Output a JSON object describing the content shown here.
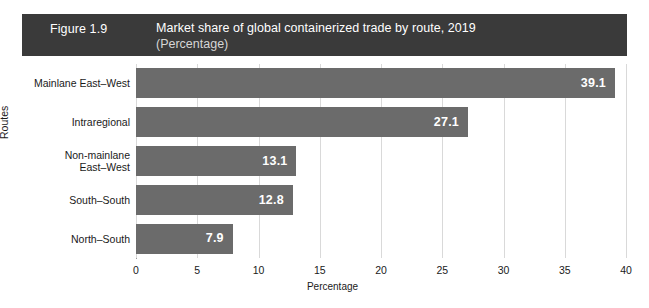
{
  "figure": {
    "number": "Figure 1.9",
    "title": "Market share of global containerized trade by route, 2019",
    "subtitle": "(Percentage)"
  },
  "colors": {
    "header_background": "#3a3a3a",
    "header_text": "#ffffff",
    "header_subtitle_text": "#d6d6d6",
    "bar_fill": "#6b6b6b",
    "bar_label_text": "#ffffff",
    "gridline": "#d9d9d9",
    "axis_line": "#9b9b9b",
    "page_background": "#ffffff"
  },
  "chart_data": {
    "type": "bar",
    "orientation": "horizontal",
    "title": "Market share of global containerized trade by route, 2019",
    "subtitle": "(Percentage)",
    "categories": [
      "Mainlane East–West",
      "Intraregional",
      "Non-mainlane East–West",
      "South–South",
      "North–South"
    ],
    "category_lines": [
      [
        "Mainlane East–West"
      ],
      [
        "Intraregional"
      ],
      [
        "Non-mainlane",
        "East–West"
      ],
      [
        "South–South"
      ],
      [
        "North–South"
      ]
    ],
    "values": [
      39.1,
      27.1,
      13.1,
      12.8,
      7.9
    ],
    "value_labels": [
      "39.1",
      "27.1",
      "13.1",
      "12.8",
      "7.9"
    ],
    "xlabel": "Percentage",
    "ylabel": "Routes",
    "xlim": [
      0,
      40
    ],
    "xticks": [
      0,
      5,
      10,
      15,
      20,
      25,
      30,
      35,
      40
    ],
    "xtick_labels": [
      "0",
      "5",
      "10",
      "15",
      "20",
      "25",
      "30",
      "35",
      "40"
    ],
    "grid": "vertical",
    "legend": null
  }
}
